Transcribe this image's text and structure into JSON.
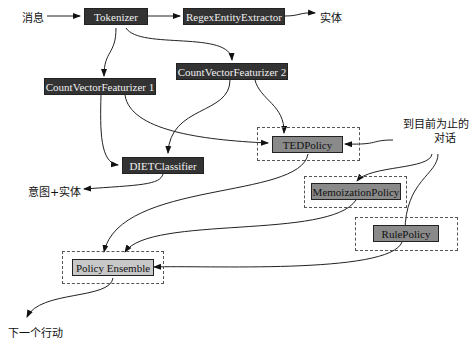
{
  "nodes": {
    "tokenizer": "Tokenizer",
    "regex": "RegexEntityExtractor",
    "cvf1": "CountVectorFeaturizer 1",
    "cvf2": "CountVectorFeaturizer 2",
    "diet": "DIETClassifier",
    "ted": "TEDPolicy",
    "memo": "MemoizationPolicy",
    "rule": "RulePolicy",
    "ensemble": "Policy Ensemble"
  },
  "labels": {
    "message": "消息",
    "entity": "实体",
    "intent_entity": "意图+实体",
    "conversation_line1": "到目前为止的",
    "conversation_line2": "对话",
    "next_action": "下一个行动"
  },
  "colors": {
    "dark_node": "#333333",
    "policy_node": "#8a8a8a",
    "ensemble_node": "#c8c8c8"
  }
}
